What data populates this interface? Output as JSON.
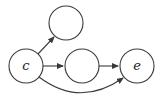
{
  "diagram": {
    "type": "directed-graph",
    "nodes": [
      {
        "id": "c",
        "label": "c",
        "cx": 26,
        "cy": 66,
        "r": 17
      },
      {
        "id": "top",
        "label": "",
        "cx": 66,
        "cy": 23,
        "r": 17
      },
      {
        "id": "mid",
        "label": "",
        "cx": 82,
        "cy": 66,
        "r": 17
      },
      {
        "id": "e",
        "label": "e",
        "cx": 137,
        "cy": 66,
        "r": 17
      }
    ],
    "edges": [
      {
        "from": "c",
        "to": "top",
        "style": "straight"
      },
      {
        "from": "c",
        "to": "mid",
        "style": "straight"
      },
      {
        "from": "mid",
        "to": "e",
        "style": "straight"
      },
      {
        "from": "c",
        "to": "e",
        "style": "curved"
      }
    ],
    "colors": {
      "stroke": "#3a3a3a",
      "fill": "#ffffff",
      "text": "#222222"
    }
  }
}
